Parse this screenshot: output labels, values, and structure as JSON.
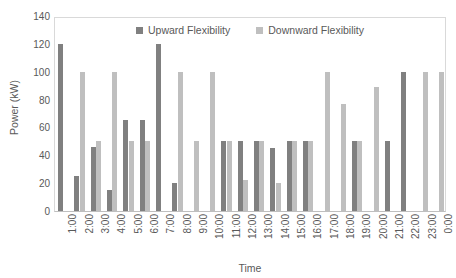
{
  "chart_data": {
    "type": "bar",
    "title": "",
    "xlabel": "Time",
    "ylabel": "Power (kW)",
    "ylim": [
      0,
      140
    ],
    "ytick_step": 20,
    "yticks": [
      0,
      20,
      40,
      60,
      80,
      100,
      120,
      140
    ],
    "grid": false,
    "legend_position": "top-center-inside",
    "categories": [
      "1:00",
      "2:00",
      "3:00",
      "4:00",
      "5:00",
      "6:00",
      "7:00",
      "8:00",
      "9:00",
      "10:00",
      "11:00",
      "12:00",
      "13:00",
      "14:00",
      "15:00",
      "16:00",
      "17:00",
      "18:00",
      "19:00",
      "20:00",
      "21:00",
      "22:00",
      "23:00",
      "0:00"
    ],
    "series": [
      {
        "name": "Upward Flexibility",
        "color": "#808080",
        "values": [
          120,
          25,
          46,
          15,
          65,
          65,
          120,
          20,
          0,
          0,
          50,
          50,
          50,
          45,
          50,
          50,
          0,
          0,
          50,
          0,
          50,
          100,
          0,
          0
        ]
      },
      {
        "name": "Downward Flexibility",
        "color": "#bfbfbf",
        "values": [
          0,
          100,
          50,
          100,
          50,
          50,
          0,
          100,
          50,
          100,
          50,
          22,
          50,
          20,
          50,
          50,
          100,
          77,
          50,
          89,
          0,
          0,
          100,
          100
        ]
      }
    ]
  },
  "axes": {
    "y_title": "Power (kW)",
    "x_title": "Time"
  },
  "legend": {
    "items": [
      {
        "label": "Upward Flexibility",
        "color": "#808080"
      },
      {
        "label": "Downward Flexibility",
        "color": "#bfbfbf"
      }
    ]
  },
  "colors": {
    "upward": "#808080",
    "downward": "#bfbfbf",
    "text": "#595959",
    "axis_line": "#d9d9d9",
    "background": "#ffffff"
  }
}
